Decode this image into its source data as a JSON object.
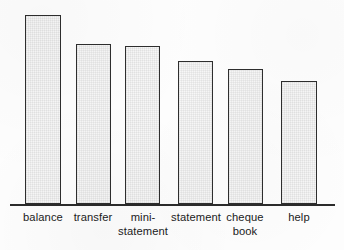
{
  "chart_data": {
    "type": "bar",
    "title": "",
    "subtitle": "",
    "xlabel": "",
    "ylabel": "",
    "grid": false,
    "legend": "none",
    "axis": {
      "baseline_y": 204,
      "x_axis_start": 10,
      "x_axis_end": 335,
      "ylim": [
        0,
        200
      ]
    },
    "categories": [
      "balance",
      "mini-statement",
      "transfer",
      "statement",
      "cheque book",
      "help"
    ],
    "bars": [
      {
        "label_line1": "balance",
        "label_line2": "",
        "value": 189,
        "x": 25,
        "width": 36,
        "top": 15,
        "height": 189,
        "label_center": 43
      },
      {
        "label_line1": "transfer",
        "label_line2": "",
        "value": 160,
        "x": 76,
        "width": 35,
        "top": 44,
        "height": 160,
        "label_center": 93
      },
      {
        "label_line1": "mini-",
        "label_line2": "statement",
        "value": 158,
        "x": 125,
        "width": 35,
        "top": 46,
        "height": 158,
        "label_center": 143
      },
      {
        "label_line1": "statement",
        "label_line2": "",
        "value": 143,
        "x": 178,
        "width": 35,
        "top": 61,
        "height": 143,
        "label_center": 196
      },
      {
        "label_line1": "cheque",
        "label_line2": "book",
        "value": 135,
        "x": 228,
        "width": 35,
        "top": 69,
        "height": 135,
        "label_center": 245
      },
      {
        "label_line1": "help",
        "label_line2": "",
        "value": 123,
        "x": 281,
        "width": 36,
        "top": 81,
        "height": 123,
        "label_center": 299
      }
    ],
    "colors": {
      "bar_fill": "#f7f7f7",
      "bar_border": "#2e2e2e",
      "axis": "#2b2b2b",
      "label_text": "#1b1b1b",
      "background": "#fdfdfd"
    }
  }
}
